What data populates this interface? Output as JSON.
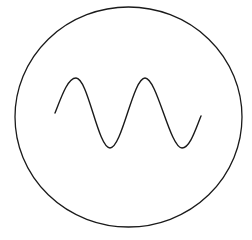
{
  "diagram": {
    "symbol": "ac-voltage-source",
    "stroke_color": "#1a1a1a",
    "background": "#ffffff",
    "circle": {
      "cx": 128.5,
      "cy": 117,
      "rx": 113.5,
      "ry": 110
    },
    "wave": {
      "start": [
        55,
        113
      ],
      "end": [
        201,
        116
      ],
      "cycles": 2,
      "amplitude": 35
    }
  }
}
